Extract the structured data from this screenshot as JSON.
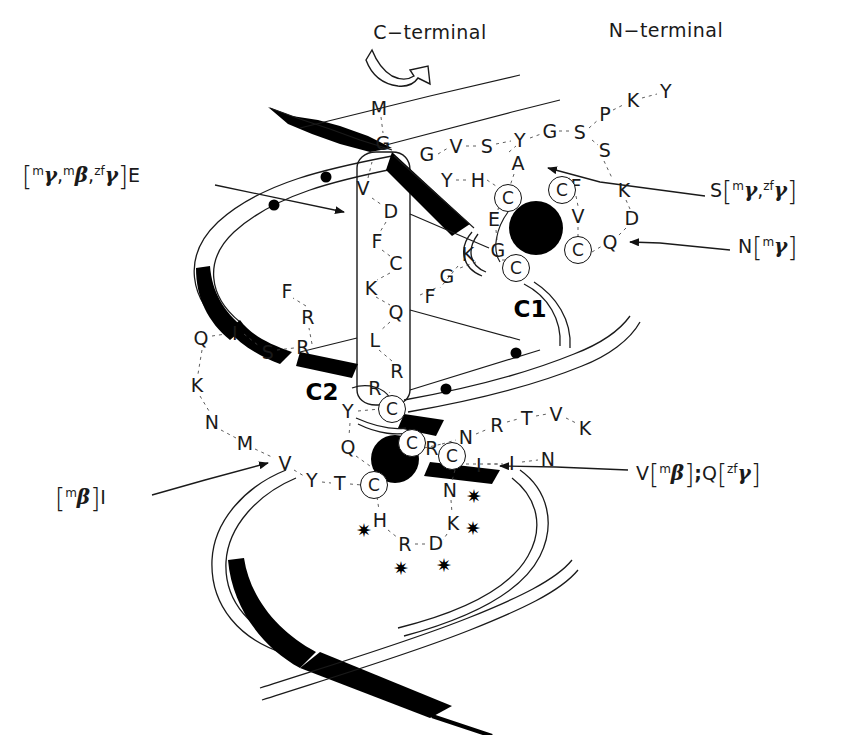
{
  "figure": {
    "type": "protein-topology-diagram",
    "background": "#ffffff",
    "ink": "#1a1a1a"
  },
  "terminals": [
    {
      "id": "c-terminal",
      "text": "C−terminal",
      "x": 430,
      "y": 32
    },
    {
      "id": "n-terminal",
      "text": "N−terminal",
      "x": 666,
      "y": 30
    }
  ],
  "domain_labels": [
    {
      "id": "c1",
      "text": "C1",
      "x": 530,
      "y": 309
    },
    {
      "id": "c2",
      "text": "C2",
      "x": 322,
      "y": 392
    }
  ],
  "annotations": [
    {
      "id": "ann-e",
      "side": "left",
      "x": 22,
      "y": 175,
      "parts": [
        {
          "t": "brk",
          "v": "["
        },
        {
          "t": "sup",
          "v": "m"
        },
        {
          "t": "gam",
          "v": "γ"
        },
        {
          "t": "txt",
          "v": ","
        },
        {
          "t": "sup",
          "v": "m"
        },
        {
          "t": "gam",
          "v": "β"
        },
        {
          "t": "txt",
          "v": ","
        },
        {
          "t": "sup",
          "v": "zf"
        },
        {
          "t": "gam",
          "v": "γ"
        },
        {
          "t": "brk",
          "v": "]"
        },
        {
          "t": "txt",
          "v": "E"
        }
      ],
      "plain": "[mγ,mβ,zfγ]E"
    },
    {
      "id": "ann-i",
      "side": "left",
      "x": 55,
      "y": 497,
      "parts": [
        {
          "t": "brk",
          "v": "["
        },
        {
          "t": "sup",
          "v": "m"
        },
        {
          "t": "gam",
          "v": "β"
        },
        {
          "t": "brk",
          "v": "]"
        },
        {
          "t": "txt",
          "v": "I"
        }
      ],
      "plain": "[mβ]I"
    },
    {
      "id": "ann-s",
      "side": "right",
      "x": 710,
      "y": 190,
      "parts": [
        {
          "t": "txt",
          "v": "S"
        },
        {
          "t": "brk",
          "v": "["
        },
        {
          "t": "sup",
          "v": "m"
        },
        {
          "t": "gam",
          "v": "γ"
        },
        {
          "t": "txt",
          "v": ","
        },
        {
          "t": "sup",
          "v": "zf"
        },
        {
          "t": "gam",
          "v": "γ"
        },
        {
          "t": "brk",
          "v": "]"
        }
      ],
      "plain": "S[mγ,zfγ]"
    },
    {
      "id": "ann-n",
      "side": "right",
      "x": 738,
      "y": 246,
      "parts": [
        {
          "t": "txt",
          "v": "N"
        },
        {
          "t": "brk",
          "v": "["
        },
        {
          "t": "sup",
          "v": "m"
        },
        {
          "t": "gam",
          "v": "γ"
        },
        {
          "t": "brk",
          "v": "]"
        }
      ],
      "plain": "N[mγ]"
    },
    {
      "id": "ann-v-q",
      "side": "right",
      "x": 636,
      "y": 473,
      "parts": [
        {
          "t": "txt",
          "v": "V"
        },
        {
          "t": "brk",
          "v": "["
        },
        {
          "t": "sup",
          "v": "m"
        },
        {
          "t": "gam",
          "v": "β"
        },
        {
          "t": "brk",
          "v": "]"
        },
        {
          "t": "bold",
          "v": ";"
        },
        {
          "t": "txt",
          "v": " Q"
        },
        {
          "t": "brk",
          "v": "["
        },
        {
          "t": "sup",
          "v": "zf"
        },
        {
          "t": "gam",
          "v": "γ"
        },
        {
          "t": "brk",
          "v": "]"
        }
      ],
      "plain": "V[mβ]; Q[zfγ]"
    }
  ],
  "residues": [
    {
      "id": "r-M",
      "t": "M",
      "x": 379,
      "y": 108
    },
    {
      "id": "r-G1",
      "t": "G",
      "x": 383,
      "y": 143
    },
    {
      "id": "r-V1",
      "t": "V",
      "x": 363,
      "y": 188
    },
    {
      "id": "r-D",
      "t": "D",
      "x": 391,
      "y": 211
    },
    {
      "id": "r-F1",
      "t": "F",
      "x": 377,
      "y": 241
    },
    {
      "id": "r-C1l",
      "t": "C",
      "x": 396,
      "y": 263
    },
    {
      "id": "r-K1",
      "t": "K",
      "x": 371,
      "y": 288
    },
    {
      "id": "r-Q1",
      "t": "Q",
      "x": 396,
      "y": 312
    },
    {
      "id": "r-L",
      "t": "L",
      "x": 375,
      "y": 340
    },
    {
      "id": "r-R1",
      "t": "R",
      "x": 397,
      "y": 371
    },
    {
      "id": "r-F2",
      "t": "F",
      "x": 430,
      "y": 296
    },
    {
      "id": "r-G2",
      "t": "G",
      "x": 447,
      "y": 276
    },
    {
      "id": "r-K2",
      "t": "K",
      "x": 468,
      "y": 254
    },
    {
      "id": "r-G3",
      "t": "G",
      "x": 427,
      "y": 154
    },
    {
      "id": "r-V2",
      "t": "V",
      "x": 456,
      "y": 146
    },
    {
      "id": "r-S1",
      "t": "S",
      "x": 487,
      "y": 146
    },
    {
      "id": "r-Y1",
      "t": "Y",
      "x": 520,
      "y": 140
    },
    {
      "id": "r-G4",
      "t": "G",
      "x": 550,
      "y": 131
    },
    {
      "id": "r-S2",
      "t": "S",
      "x": 580,
      "y": 132
    },
    {
      "id": "r-P",
      "t": "P",
      "x": 605,
      "y": 114
    },
    {
      "id": "r-K3",
      "t": "K",
      "x": 633,
      "y": 100
    },
    {
      "id": "r-Y2",
      "t": "Y",
      "x": 666,
      "y": 91
    },
    {
      "id": "r-S3",
      "t": "S",
      "x": 605,
      "y": 150
    },
    {
      "id": "r-A",
      "t": "A",
      "x": 518,
      "y": 163
    },
    {
      "id": "r-Y3",
      "t": "Y",
      "x": 447,
      "y": 180
    },
    {
      "id": "r-H1",
      "t": "H",
      "x": 478,
      "y": 180
    },
    {
      "id": "r-E1",
      "t": "E",
      "x": 494,
      "y": 219
    },
    {
      "id": "r-G5",
      "t": "G",
      "x": 498,
      "y": 250
    },
    {
      "id": "r-F3",
      "t": "F",
      "x": 576,
      "y": 186
    },
    {
      "id": "r-V3",
      "t": "V",
      "x": 578,
      "y": 216
    },
    {
      "id": "r-K4",
      "t": "K",
      "x": 624,
      "y": 190
    },
    {
      "id": "r-D2",
      "t": "D",
      "x": 632,
      "y": 218
    },
    {
      "id": "r-Q2",
      "t": "Q",
      "x": 610,
      "y": 242
    },
    {
      "id": "r-Q3",
      "t": "Q",
      "x": 201,
      "y": 338
    },
    {
      "id": "r-I1",
      "t": "I",
      "x": 235,
      "y": 333
    },
    {
      "id": "r-S4",
      "t": "S",
      "x": 268,
      "y": 352
    },
    {
      "id": "r-R2",
      "t": "R",
      "x": 303,
      "y": 347
    },
    {
      "id": "r-R3",
      "t": "R",
      "x": 308,
      "y": 317
    },
    {
      "id": "r-F4",
      "t": "F",
      "x": 287,
      "y": 291
    },
    {
      "id": "r-K5",
      "t": "K",
      "x": 197,
      "y": 385
    },
    {
      "id": "r-N1",
      "t": "N",
      "x": 212,
      "y": 422
    },
    {
      "id": "r-M2",
      "t": "M",
      "x": 245,
      "y": 443
    },
    {
      "id": "r-V4",
      "t": "V",
      "x": 285,
      "y": 463
    },
    {
      "id": "r-Y4",
      "t": "Y",
      "x": 312,
      "y": 480
    },
    {
      "id": "r-T1",
      "t": "T",
      "x": 340,
      "y": 483
    },
    {
      "id": "r-Y5",
      "t": "Y",
      "x": 348,
      "y": 411
    },
    {
      "id": "r-Q4",
      "t": "Q",
      "x": 348,
      "y": 447
    },
    {
      "id": "r-R4",
      "t": "R",
      "x": 375,
      "y": 388
    },
    {
      "id": "r-R5",
      "t": "R",
      "x": 432,
      "y": 448
    },
    {
      "id": "r-N2",
      "t": "N",
      "x": 466,
      "y": 437
    },
    {
      "id": "r-R6",
      "t": "R",
      "x": 497,
      "y": 425
    },
    {
      "id": "r-T2",
      "t": "T",
      "x": 527,
      "y": 418
    },
    {
      "id": "r-V5",
      "t": "V",
      "x": 556,
      "y": 414
    },
    {
      "id": "r-K6",
      "t": "K",
      "x": 585,
      "y": 428
    },
    {
      "id": "r-I2",
      "t": "I",
      "x": 479,
      "y": 465
    },
    {
      "id": "r-I3",
      "t": "I",
      "x": 512,
      "y": 463
    },
    {
      "id": "r-N3",
      "t": "N",
      "x": 548,
      "y": 459
    },
    {
      "id": "r-N4",
      "t": "N",
      "x": 450,
      "y": 490
    },
    {
      "id": "r-K7",
      "t": "K",
      "x": 453,
      "y": 523
    },
    {
      "id": "r-H2",
      "t": "H",
      "x": 380,
      "y": 520
    },
    {
      "id": "r-R7",
      "t": "R",
      "x": 405,
      "y": 544
    },
    {
      "id": "r-D3",
      "t": "D",
      "x": 436,
      "y": 543
    }
  ],
  "cysteines": [
    {
      "id": "cys-1",
      "t": "C",
      "x": 508,
      "y": 198
    },
    {
      "id": "cys-2",
      "t": "C",
      "x": 562,
      "y": 190
    },
    {
      "id": "cys-3",
      "t": "C",
      "x": 516,
      "y": 268
    },
    {
      "id": "cys-4",
      "t": "C",
      "x": 578,
      "y": 250
    },
    {
      "id": "cys-5",
      "t": "C",
      "x": 392,
      "y": 409
    },
    {
      "id": "cys-6",
      "t": "C",
      "x": 412,
      "y": 443
    },
    {
      "id": "cys-7",
      "t": "C",
      "x": 452,
      "y": 456
    },
    {
      "id": "cys-8",
      "t": "C",
      "x": 374,
      "y": 485
    }
  ],
  "zinc_atoms": [
    {
      "id": "zinc-1",
      "x": 536,
      "y": 228,
      "r": 27
    },
    {
      "id": "zinc-2",
      "x": 395,
      "y": 459,
      "r": 24
    }
  ],
  "strand_dots": [
    {
      "id": "dot-1",
      "x": 326,
      "y": 177
    },
    {
      "id": "dot-2",
      "x": 274,
      "y": 205
    },
    {
      "id": "dot-3",
      "x": 516,
      "y": 353
    },
    {
      "id": "dot-4",
      "x": 446,
      "y": 389
    }
  ],
  "asterisks": [
    {
      "id": "ast-1",
      "x": 474,
      "y": 496
    },
    {
      "id": "ast-2",
      "x": 473,
      "y": 528
    },
    {
      "id": "ast-3",
      "x": 364,
      "y": 530
    },
    {
      "id": "ast-4",
      "x": 401,
      "y": 568
    },
    {
      "id": "ast-5",
      "x": 444,
      "y": 565
    },
    {
      "id": "ast-glyph",
      "x": 0,
      "y": 0
    }
  ],
  "asterisk_glyph": "✷",
  "icons": {
    "c_terminal_arrow": "curved-outline-arrow",
    "pointer_arrow": "solid-triangle-arrow"
  }
}
